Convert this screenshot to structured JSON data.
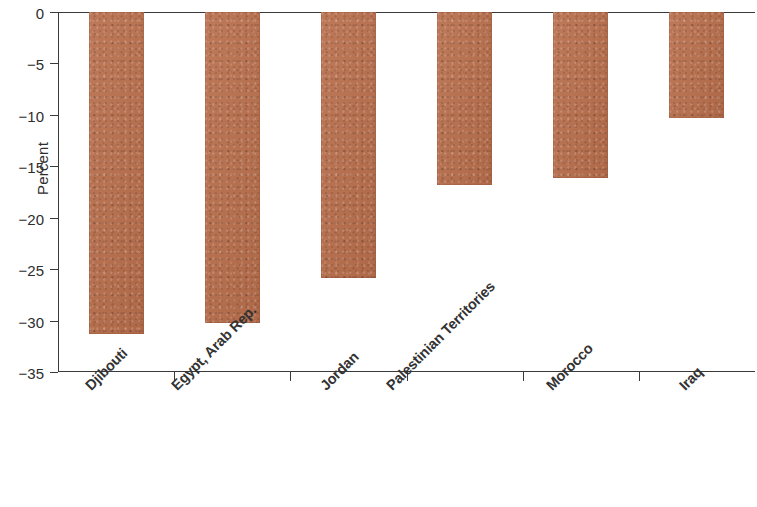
{
  "chart_data": {
    "type": "bar",
    "title": "",
    "subtitle": "",
    "xlabel": "",
    "ylabel": "Percent",
    "categories": [
      "Djibouti",
      "Egypt, Arab Rep.",
      "Jordan",
      "Palestinian Territories",
      "Morocco",
      "Iraq"
    ],
    "values": [
      -31.3,
      -30.2,
      -25.9,
      -16.8,
      -16.1,
      -10.3
    ],
    "ylim": [
      -35,
      0
    ],
    "ytick_labels": [
      "0",
      "−5",
      "−10",
      "−15",
      "−20",
      "−25",
      "−30",
      "−35"
    ],
    "ytick_values": [
      0,
      -5,
      -10,
      -15,
      -20,
      -25,
      -30,
      -35
    ],
    "grid": false,
    "legend": false,
    "legend_position": "none",
    "bar_color": "#b96f4d",
    "axis_color": "#3a3a3a",
    "orientation": "vertical",
    "label_rotation": -45
  }
}
